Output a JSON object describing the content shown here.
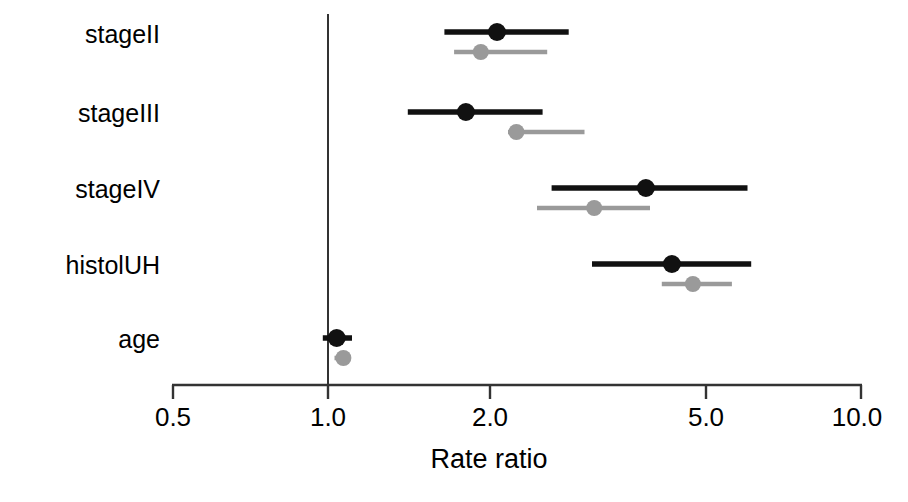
{
  "chart_data": {
    "type": "forest",
    "title": "",
    "xlabel": "Rate ratio",
    "ylabel": "",
    "xscale": "log",
    "xlim": [
      0.5,
      10.0
    ],
    "xticks": [
      0.5,
      1.0,
      2.0,
      5.0,
      10.0
    ],
    "xtick_labels": [
      "0.5",
      "1.0",
      "2.0",
      "5.0",
      "10.0"
    ],
    "grid": false,
    "legend": "none",
    "reference_line": 1.0,
    "categories": [
      "stageII",
      "stageIII",
      "stageIV",
      "histolUH",
      "age"
    ],
    "series": [
      {
        "name": "black",
        "color": "#111111",
        "estimates": [
          2.05,
          1.79,
          3.92,
          4.39,
          1.02
        ],
        "ci_low": [
          1.63,
          1.39,
          2.6,
          3.1,
          0.96
        ],
        "ci_high": [
          2.8,
          2.5,
          6.1,
          6.2,
          1.09
        ]
      },
      {
        "name": "gray",
        "color": "#9a9a9a",
        "estimates": [
          1.91,
          2.23,
          3.13,
          4.81,
          1.05
        ],
        "ci_low": [
          1.7,
          2.15,
          2.44,
          4.2,
          1.01
        ],
        "ci_high": [
          2.55,
          3.0,
          3.99,
          5.7,
          1.08
        ]
      }
    ]
  },
  "axis": {
    "tick_labels": [
      "0.5",
      "1.0",
      "2.0",
      "5.0",
      "10.0"
    ],
    "title": "Rate ratio"
  },
  "y_categories": [
    "stageII",
    "stageIII",
    "stageIV",
    "histolUH",
    "age"
  ],
  "colors": {
    "black_series": "#111111",
    "gray_series": "#9a9a9a",
    "axis": "#333333",
    "background": "#ffffff"
  }
}
